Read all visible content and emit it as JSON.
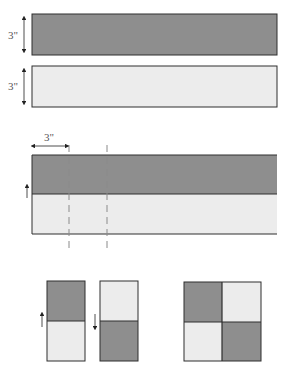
{
  "colors": {
    "dark_fabric": "#8e8e8e",
    "light_fabric": "#ececec",
    "outline": "#2e2e2e",
    "dim_line": "#222222",
    "dashed_line": "#8a8a8a",
    "label": "#555555"
  },
  "step1": {
    "strip_dark": {
      "dimension_label": "3\""
    },
    "strip_light": {
      "dimension_label": "3\""
    }
  },
  "step2": {
    "cut_width_label": "3\"",
    "press_direction": "up"
  },
  "step3": {
    "unit_a": {
      "top": "dark",
      "bottom": "light",
      "press_direction": "up"
    },
    "unit_b": {
      "top": "light",
      "bottom": "dark",
      "press_direction": "down"
    },
    "four_patch": {
      "cells": [
        "dark",
        "light",
        "light",
        "dark"
      ]
    }
  }
}
